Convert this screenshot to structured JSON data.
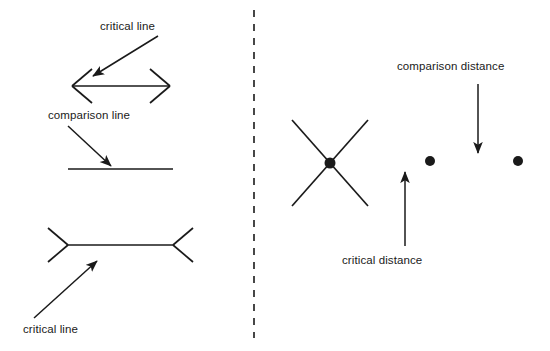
{
  "figure": {
    "background_color": "#ffffff",
    "stroke_color": "#1a1a1a",
    "text_color": "#1a1a1a",
    "width": 550,
    "height": 351
  },
  "divider": {
    "name": "vertical-dashed-divider",
    "x": 254,
    "y1": 10,
    "y2": 338,
    "dash": "7,7"
  },
  "left_panel": {
    "labels": [
      {
        "id": "critical-line-top",
        "text": "critical line",
        "x": 100,
        "y": 20
      },
      {
        "id": "comparison-line",
        "text": "comparison line",
        "x": 48,
        "y": 109
      },
      {
        "id": "critical-line-bottom",
        "text": "critical line",
        "x": 23,
        "y": 323
      }
    ],
    "annotation_arrows": [
      {
        "id": "arrow-to-critical-line-top",
        "from_x": 158,
        "from_y": 36,
        "to_x": 93,
        "to_y": 76
      },
      {
        "id": "arrow-to-comparison-line",
        "from_x": 68,
        "from_y": 126,
        "to_x": 111,
        "to_y": 166
      },
      {
        "id": "arrow-to-critical-line-bottom",
        "from_x": 34,
        "from_y": 318,
        "to_x": 97,
        "to_y": 261
      }
    ],
    "shapes": [
      {
        "id": "double-headed-arrow-outward-fins",
        "type": "muller-lyer-outward",
        "x1": 72,
        "x2": 170,
        "y": 86,
        "fin_dx": 20,
        "fin_dy": 17
      },
      {
        "id": "plain-comparison-line",
        "type": "plain-line",
        "x1": 68,
        "x2": 173,
        "y": 169
      },
      {
        "id": "double-ended-inward-fins",
        "type": "muller-lyer-inward",
        "x1": 68,
        "x2": 173,
        "y": 245,
        "fin_dx": 20,
        "fin_dy": 17
      }
    ]
  },
  "right_panel": {
    "labels": [
      {
        "id": "comparison-distance",
        "text": "comparison distance",
        "x": 397,
        "y": 60
      },
      {
        "id": "critical-distance",
        "text": "critical distance",
        "x": 342,
        "y": 254
      }
    ],
    "annotation_arrows": [
      {
        "id": "arrow-comparison-distance",
        "from_x": 478,
        "from_y": 84,
        "to_x": 478,
        "to_y": 153
      },
      {
        "id": "arrow-critical-distance",
        "from_x": 405,
        "from_y": 246,
        "to_x": 405,
        "to_y": 172
      }
    ],
    "shapes": [
      {
        "id": "x-cross-with-center-dot",
        "type": "x-cross",
        "center_x": 330,
        "center_y": 163,
        "arm_dx": 38,
        "arm_dy": 43,
        "dot_radius": 5.5
      }
    ],
    "dots": [
      {
        "id": "dot-middle",
        "cx": 430,
        "cy": 161,
        "r": 5
      },
      {
        "id": "dot-right",
        "cx": 518,
        "cy": 161,
        "r": 5
      }
    ]
  }
}
